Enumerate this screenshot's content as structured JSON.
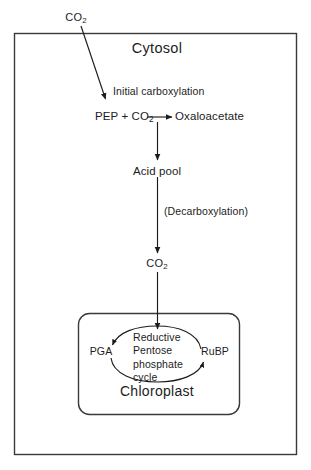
{
  "diagram": {
    "compartments": {
      "outer": {
        "label": "Cytosol"
      },
      "inner": {
        "label": "Chloroplast"
      }
    },
    "nodes": {
      "co2_external": {
        "text": "CO",
        "subscript": "2"
      },
      "pep_pool": {
        "text": "PEP + CO",
        "subscript": "2"
      },
      "oxaloacetate": {
        "text": "Oxaloacetate"
      },
      "acid_pool": {
        "text": "Acid pool"
      },
      "co2_released": {
        "text": "CO",
        "subscript": "2"
      },
      "pga": {
        "text": "PGA"
      },
      "rubp": {
        "text": "RuBP"
      }
    },
    "process_labels": {
      "initial_carboxylation": "Initial carboxylation",
      "decarboxylation": "(Decarboxylation)",
      "cycle_line_1": "Reductive",
      "cycle_line_2": "Pentose",
      "cycle_line_3": "phosphate",
      "cycle_line_4": "cycle"
    },
    "colors": {
      "ink": "#1c1c1c",
      "stroke": "#2a2a2a",
      "background": "#ffffff"
    }
  }
}
